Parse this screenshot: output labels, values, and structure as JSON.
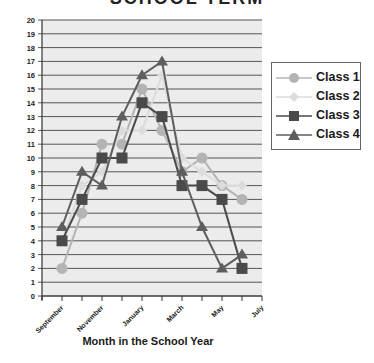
{
  "chart_data": {
    "type": "line",
    "title": "SCHOOL TERM",
    "xlabel": "Month in the School Year",
    "ylabel": "",
    "ylim": [
      0,
      20
    ],
    "yticks": [
      0,
      1,
      2,
      3,
      4,
      5,
      6,
      7,
      8,
      9,
      10,
      11,
      12,
      13,
      14,
      15,
      16,
      17,
      18,
      19,
      20
    ],
    "x_tick_labels": [
      "September",
      "November",
      "January",
      "March",
      "May",
      "July"
    ],
    "categories": [
      "September",
      "October",
      "November",
      "December",
      "January",
      "February",
      "March",
      "April",
      "May",
      "June"
    ],
    "grid": true,
    "legend_position": "right",
    "series": [
      {
        "name": "Class 1",
        "marker": "circle",
        "color": "#b4b4b4",
        "values": [
          2,
          6,
          11,
          11,
          15,
          12,
          9,
          10,
          8,
          7
        ]
      },
      {
        "name": "Class 2",
        "marker": "diamond",
        "color": "#dcdcdc",
        "values": [
          4,
          8,
          9,
          12,
          12,
          16,
          10,
          9,
          8,
          8
        ]
      },
      {
        "name": "Class 3",
        "marker": "square",
        "color": "#4a4a4a",
        "values": [
          4,
          7,
          10,
          10,
          14,
          13,
          8,
          8,
          7,
          2
        ]
      },
      {
        "name": "Class 4",
        "marker": "triangle",
        "color": "#5e5e5e",
        "values": [
          5,
          9,
          8,
          13,
          16,
          17,
          9,
          5,
          2,
          3
        ]
      }
    ]
  },
  "legend": {
    "items": [
      {
        "label": "Class 1"
      },
      {
        "label": "Class 2"
      },
      {
        "label": "Class 3"
      },
      {
        "label": "Class 4"
      }
    ]
  },
  "axis": {
    "x_title": "Month in the School Year"
  },
  "title": "SCHOOL TERM"
}
